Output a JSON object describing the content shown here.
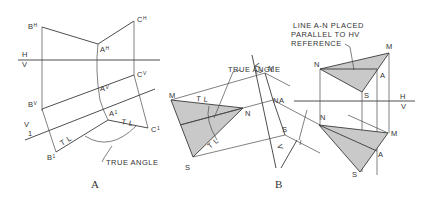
{
  "figure_a": {
    "caption": "A",
    "points": {
      "BH": "B",
      "BH_sup": "H",
      "CH": "C",
      "CH_sup": "H",
      "AH": "A",
      "AH_sup": "H",
      "CV": "C",
      "CV_sup": "V",
      "AV": "A",
      "AV_sup": "V",
      "BV": "B",
      "BV_sup": "V",
      "A1": "A",
      "A1_sup": "1",
      "B1": "B",
      "B1_sup": "1",
      "C1": "C",
      "C1_sup": "1"
    },
    "ref_hv_top": "H",
    "ref_hv_bottom": "V",
    "ref_v1_top": "V",
    "ref_v1_bottom": "1",
    "tl_1": "T L",
    "tl_2": "T L",
    "true_angle_label": "TRUE ANGLE"
  },
  "figure_b": {
    "caption": "B",
    "true_angle_label": "TRUE ANGLE",
    "note_line1": "LINE A-N PLACED",
    "note_line2": "PARALLEL TO HV",
    "note_line3": "REFERENCE",
    "left_view": {
      "M": "M",
      "N": "N",
      "S": "S",
      "tl_1": "T L",
      "tl_2": "T L"
    },
    "edge_view": {
      "M": "M",
      "NA": "NA",
      "S": "S",
      "ref_top_1": "V",
      "ref_top_2": "2",
      "ref_bottom": "V"
    },
    "top_view": {
      "N": "N",
      "M": "M",
      "A": "A",
      "S": "S"
    },
    "bottom_view": {
      "N": "N",
      "M": "M",
      "A": "A",
      "S": "S"
    },
    "ref_hv_top": "H",
    "ref_hv_bottom": "V"
  }
}
